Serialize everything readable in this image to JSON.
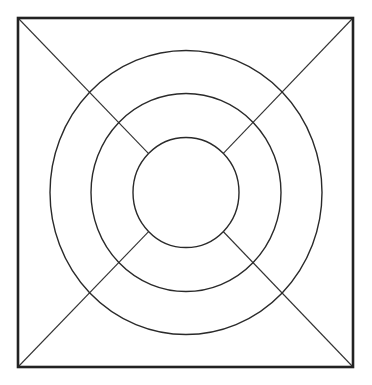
{
  "diagram": {
    "type": "geometric-figure",
    "canvas": {
      "width": 372,
      "height": 385,
      "background": "#ffffff"
    },
    "center": {
      "x": 186,
      "y": 192.5
    },
    "square": {
      "x1": 18,
      "y1": 18,
      "x2": 353,
      "y2": 367,
      "stroke": "#222222",
      "stroke_width": 2.6
    },
    "circles": [
      {
        "name": "outer",
        "rx": 136,
        "ry": 142,
        "stroke": "#2a2a2a",
        "stroke_width": 1.4
      },
      {
        "name": "middle",
        "rx": 95,
        "ry": 99,
        "stroke": "#2a2a2a",
        "stroke_width": 1.4
      },
      {
        "name": "inner",
        "rx": 53,
        "ry": 55,
        "stroke": "#2a2a2a",
        "stroke_width": 1.4
      }
    ],
    "diagonals": [
      {
        "name": "top-left",
        "from": [
          18,
          18
        ],
        "to": [
          148.6,
          153.6
        ]
      },
      {
        "name": "top-right",
        "from": [
          353,
          18
        ],
        "to": [
          223.1,
          153.7
        ]
      },
      {
        "name": "bottom-left",
        "from": [
          18,
          367
        ],
        "to": [
          148.6,
          231.6
        ]
      },
      {
        "name": "bottom-right",
        "from": [
          353,
          367
        ],
        "to": [
          223.2,
          231.5
        ]
      }
    ],
    "diagonal_style": {
      "stroke": "#333333",
      "stroke_width": 1.1
    }
  }
}
